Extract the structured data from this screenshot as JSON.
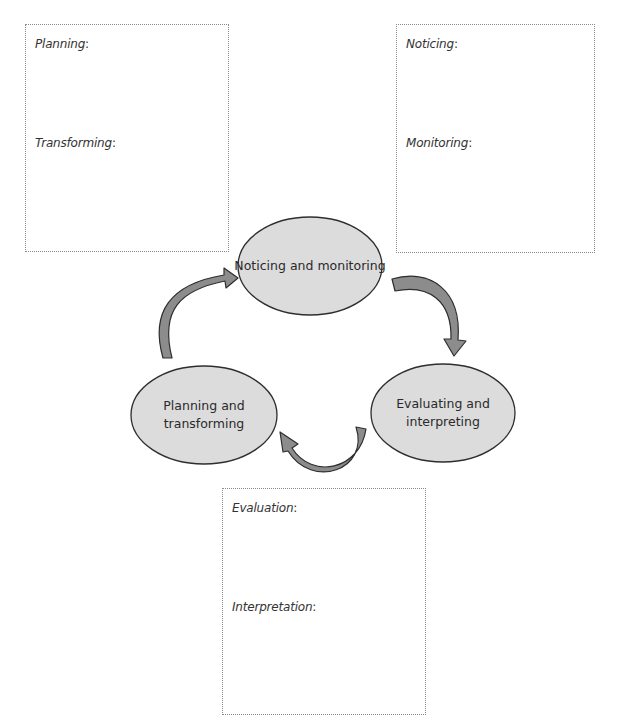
{
  "diagram": {
    "colors": {
      "node_fill": "#dcdcdc",
      "node_stroke": "#2e2e2e",
      "arrow_fill": "#8c8c8c",
      "arrow_stroke": "#2e2e2e",
      "box_border": "#8a8a8a",
      "label_text": "#333333"
    },
    "nodes": [
      {
        "id": "noticing",
        "lines": [
          "Noticing and monitoring"
        ]
      },
      {
        "id": "evaluating",
        "lines": [
          "Evaluating and",
          "interpreting"
        ]
      },
      {
        "id": "planning",
        "lines": [
          "Planning and",
          "transforming"
        ]
      }
    ],
    "edges": [
      {
        "from": "noticing",
        "to": "evaluating"
      },
      {
        "from": "evaluating",
        "to": "planning"
      },
      {
        "from": "planning",
        "to": "noticing"
      }
    ],
    "boxes": {
      "planning_box": {
        "label_1": "Planning",
        "label_2": "Transforming"
      },
      "noticing_box": {
        "label_1": "Noticing",
        "label_2": "Monitoring"
      },
      "evaluation_box": {
        "label_1": "Evaluation",
        "label_2": "Interpretation"
      }
    },
    "colon": ":"
  }
}
